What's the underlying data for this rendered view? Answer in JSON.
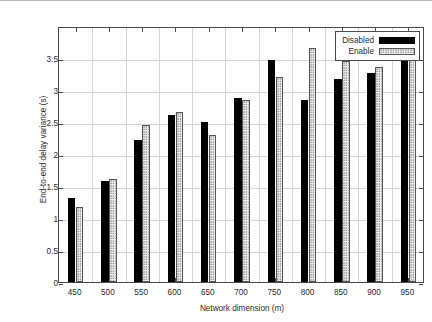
{
  "chart_data": {
    "type": "bar",
    "title": "",
    "xlabel": "Network dimension (m)",
    "ylabel": "End-to-end delay variance (s)",
    "categories": [
      "450",
      "500",
      "550",
      "600",
      "650",
      "700",
      "750",
      "800",
      "850",
      "900",
      "950"
    ],
    "series": [
      {
        "name": "Disabled",
        "color": "#000000",
        "fill": "solid",
        "values": [
          1.31,
          1.58,
          2.22,
          2.61,
          2.5,
          2.87,
          3.47,
          2.84,
          3.17,
          3.26,
          3.81
        ]
      },
      {
        "name": "Enable",
        "color": "#f2f2f2",
        "fill": "dotted-hatch",
        "values": [
          1.17,
          1.61,
          2.46,
          2.65,
          2.29,
          2.85,
          3.2,
          3.66,
          3.45,
          3.36,
          3.74
        ]
      }
    ],
    "ylim": [
      0,
      4
    ],
    "yticks": [
      "0",
      "0.5",
      "1",
      "1.5",
      "2",
      "2.5",
      "3",
      "3.5"
    ],
    "ytick_values": [
      0,
      0.5,
      1,
      1.5,
      2,
      2.5,
      3,
      3.5
    ],
    "xlim": [
      425,
      975
    ],
    "grid": true,
    "legend_position": "top-right",
    "legend_entries": [
      "Disabled",
      "Enable"
    ]
  }
}
